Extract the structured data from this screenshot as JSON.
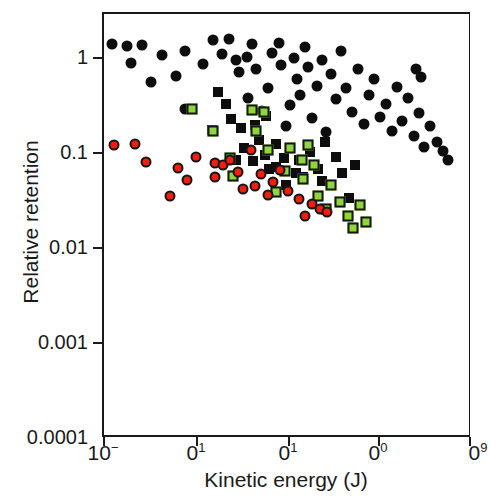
{
  "figure": {
    "width": 491,
    "height": 500,
    "background": "#ffffff"
  },
  "axes": {
    "x_title": "Kinetic energy (J)",
    "y_title": "Relative retention",
    "x_tick_labels": [
      "10−",
      "0¹",
      "0¹",
      "0⁰",
      "0⁹"
    ],
    "x_tick_bases": [
      "10",
      "0",
      "0",
      "0",
      "0"
    ],
    "x_tick_exps": [
      "−",
      "1",
      "1",
      "0",
      "9"
    ],
    "y_tick_labels": [
      "1",
      "0.1",
      "0.01",
      "0.001",
      "0.0001"
    ]
  },
  "chart_data": {
    "type": "scatter",
    "title": "",
    "xlabel": "Kinetic energy (J)",
    "ylabel": "Relative retention",
    "xscale": "log",
    "yscale": "log",
    "grid": false,
    "legend": "none",
    "ylim": [
      0.0001,
      1.6
    ],
    "y_ticks": [
      1,
      0.1,
      0.01,
      0.001,
      0.0001
    ],
    "x_ticks_px": [
      103,
      196,
      288,
      378,
      470
    ],
    "x_tick_labels_clipped": [
      "10−",
      "0¹",
      "0¹",
      "0⁰",
      "0⁹"
    ],
    "colors": {
      "black": "#0d0d0d",
      "red": "#f51d0e",
      "green": "#8ed63b",
      "outline": "#161616",
      "axis": "#1a1a1a"
    },
    "series": [
      {
        "name": "black-circles",
        "marker": "circle",
        "color": "#0d0d0d",
        "points_px": [
          [
            127,
            46
          ],
          [
            142,
            45
          ],
          [
            131,
            63
          ],
          [
            151,
            82
          ],
          [
            176,
            76
          ],
          [
            185,
            109
          ],
          [
            203,
            64
          ],
          [
            213,
            40
          ],
          [
            222,
            54
          ],
          [
            229,
            39
          ],
          [
            236,
            60
          ],
          [
            239,
            72
          ],
          [
            247,
            57
          ],
          [
            252,
            44
          ],
          [
            256,
            69
          ],
          [
            248,
            98
          ],
          [
            262,
            111
          ],
          [
            268,
            88
          ],
          [
            272,
            53
          ],
          [
            279,
            43
          ],
          [
            281,
            65
          ],
          [
            286,
            126
          ],
          [
            290,
            105
          ],
          [
            294,
            58
          ],
          [
            297,
            79
          ],
          [
            300,
            95
          ],
          [
            305,
            47
          ],
          [
            308,
            67
          ],
          [
            312,
            118
          ],
          [
            317,
            86
          ],
          [
            322,
            60
          ],
          [
            326,
            132
          ],
          [
            331,
            74
          ],
          [
            336,
            99
          ],
          [
            341,
            51
          ],
          [
            346,
            88
          ],
          [
            352,
            112
          ],
          [
            358,
            69
          ],
          [
            364,
            124
          ],
          [
            369,
            95
          ],
          [
            374,
            79
          ],
          [
            380,
            117
          ],
          [
            386,
            104
          ],
          [
            392,
            131
          ],
          [
            397,
            87
          ],
          [
            402,
            121
          ],
          [
            408,
            98
          ],
          [
            414,
            136
          ],
          [
            419,
            113
          ],
          [
            424,
            147
          ],
          [
            430,
            126
          ],
          [
            437,
            142
          ],
          [
            443,
            151
          ],
          [
            448,
            160
          ],
          [
            416,
            69
          ],
          [
            421,
            77
          ],
          [
            185,
            51
          ],
          [
            162,
            55
          ],
          [
            112,
            44
          ]
        ],
        "y_values": [
          0.94,
          0.96,
          0.78,
          0.57,
          0.62,
          0.35,
          0.74,
          1.05,
          0.86,
          1.08,
          0.8,
          0.64,
          0.88,
          0.99,
          0.7,
          0.45,
          0.38,
          0.5,
          0.9,
          1.02,
          0.77,
          0.3,
          0.37,
          0.85,
          0.59,
          0.43,
          0.97,
          0.72,
          0.33,
          0.52,
          0.82,
          0.28,
          0.61,
          0.42,
          0.93,
          0.5,
          0.34,
          0.7,
          0.29,
          0.43,
          0.56,
          0.33,
          0.39,
          0.27,
          0.51,
          0.32,
          0.42,
          0.25,
          0.34,
          0.22,
          0.3,
          0.24,
          0.21,
          0.19,
          0.7,
          0.63,
          0.91,
          0.87,
          0.98
        ]
      },
      {
        "name": "black-squares",
        "marker": "square",
        "color": "#0d0d0d",
        "points_px": [
          [
            218,
            92
          ],
          [
            226,
            104
          ],
          [
            231,
            119
          ],
          [
            241,
            128
          ],
          [
            212,
            130
          ],
          [
            255,
            125
          ],
          [
            259,
            140
          ],
          [
            266,
            116
          ],
          [
            276,
            144
          ],
          [
            284,
            158
          ],
          [
            290,
            148
          ],
          [
            299,
            160
          ],
          [
            310,
            152
          ],
          [
            318,
            169
          ],
          [
            325,
            142
          ],
          [
            336,
            157
          ],
          [
            342,
            173
          ],
          [
            349,
            198
          ],
          [
            355,
            165
          ],
          [
            286,
            185
          ],
          [
            296,
            173
          ],
          [
            303,
            177
          ],
          [
            253,
            161
          ],
          [
            244,
            148
          ],
          [
            236,
            160
          ],
          [
            269,
            169
          ],
          [
            322,
            181
          ],
          [
            276,
            167
          ],
          [
            265,
            155
          ]
        ],
        "y_values": [
          0.49,
          0.4,
          0.33,
          0.29,
          0.28,
          0.3,
          0.25,
          0.34,
          0.24,
          0.2,
          0.22,
          0.19,
          0.21,
          0.17,
          0.23,
          0.2,
          0.16,
          0.11,
          0.18,
          0.14,
          0.17,
          0.16,
          0.21,
          0.25,
          0.21,
          0.17,
          0.15,
          0.17,
          0.19
        ]
      },
      {
        "name": "green-squares",
        "marker": "square",
        "color": "#8ed63b",
        "points_px": [
          [
            213,
            131
          ],
          [
            192,
            109
          ],
          [
            252,
            110
          ],
          [
            264,
            112
          ],
          [
            230,
            158
          ],
          [
            233,
            176
          ],
          [
            256,
            131
          ],
          [
            268,
            150
          ],
          [
            276,
            192
          ],
          [
            290,
            148
          ],
          [
            302,
            160
          ],
          [
            308,
            145
          ],
          [
            318,
            196
          ],
          [
            326,
            209
          ],
          [
            331,
            185
          ],
          [
            340,
            202
          ],
          [
            348,
            216
          ],
          [
            353,
            228
          ],
          [
            360,
            205
          ],
          [
            366,
            222
          ],
          [
            303,
            179
          ],
          [
            285,
            171
          ],
          [
            314,
            165
          ]
        ],
        "y_values": [
          0.28,
          0.4,
          0.39,
          0.38,
          0.2,
          0.15,
          0.28,
          0.21,
          0.12,
          0.22,
          0.19,
          0.23,
          0.11,
          0.086,
          0.13,
          0.1,
          0.077,
          0.062,
          0.095,
          0.073,
          0.14,
          0.17,
          0.18
        ]
      },
      {
        "name": "red-circles",
        "marker": "circle",
        "color": "#f51d0e",
        "points_px": [
          [
            114,
            145
          ],
          [
            135,
            144
          ],
          [
            146,
            162
          ],
          [
            170,
            196
          ],
          [
            187,
            180
          ],
          [
            215,
            163
          ],
          [
            223,
            165
          ],
          [
            230,
            160
          ],
          [
            238,
            172
          ],
          [
            251,
            150
          ],
          [
            261,
            174
          ],
          [
            255,
            186
          ],
          [
            268,
            195
          ],
          [
            273,
            182
          ],
          [
            280,
            170
          ],
          [
            299,
            199
          ],
          [
            312,
            204
          ],
          [
            320,
            209
          ],
          [
            327,
            212
          ],
          [
            305,
            216
          ],
          [
            215,
            177
          ],
          [
            243,
            189
          ],
          [
            196,
            157
          ],
          [
            178,
            168
          ],
          [
            288,
            191
          ]
        ],
        "y_values": [
          0.113,
          0.115,
          0.086,
          0.043,
          0.061,
          0.084,
          0.082,
          0.087,
          0.071,
          0.095,
          0.069,
          0.056,
          0.047,
          0.06,
          0.074,
          0.042,
          0.037,
          0.033,
          0.031,
          0.029,
          0.064,
          0.05,
          0.093,
          0.079,
          0.048
        ]
      }
    ]
  }
}
